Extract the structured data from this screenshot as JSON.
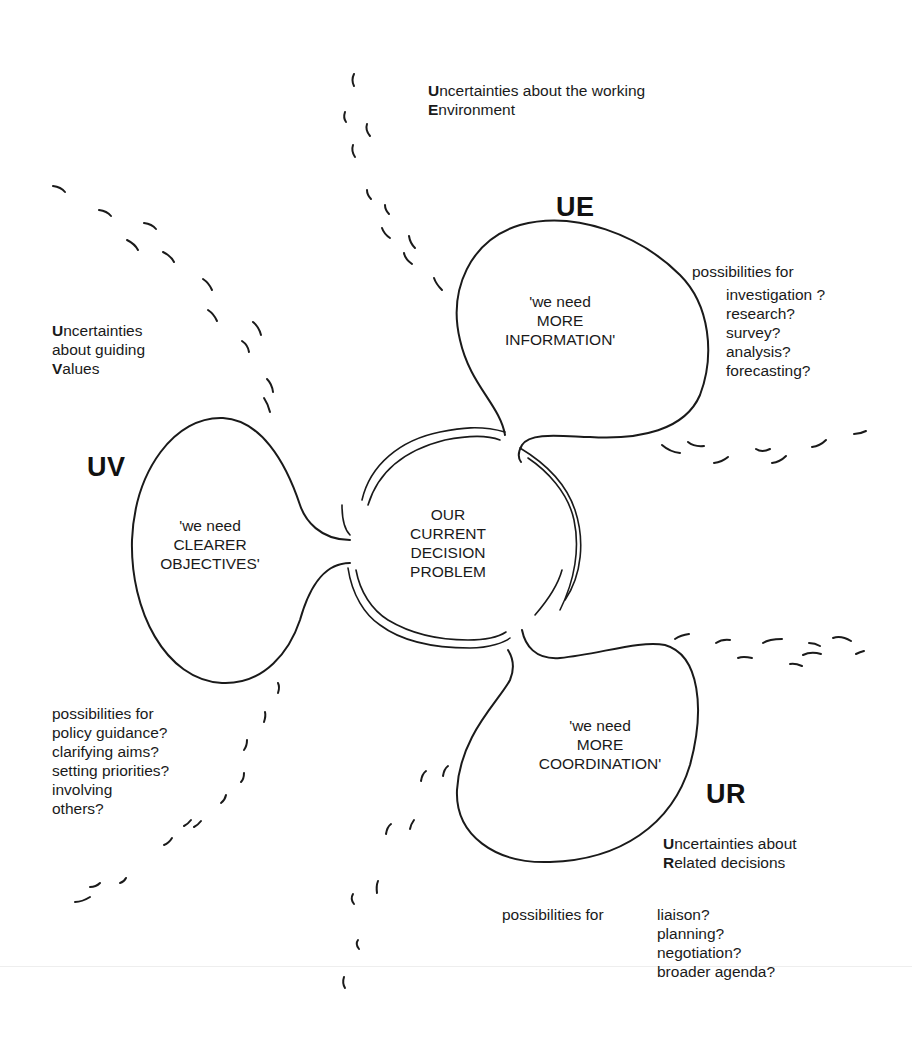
{
  "center": {
    "lines": [
      "OUR",
      "CURRENT",
      "DECISION",
      "PROBLEM"
    ]
  },
  "ue": {
    "code": "UE",
    "heading_line1_cap": "U",
    "heading_line1_rest": "ncertainties about the working",
    "heading_line2_cap": "E",
    "heading_line2_rest": "nvironment",
    "bubble_lines": [
      "'we need",
      "MORE",
      "INFORMATION'"
    ],
    "possibilities_label": "possibilities for",
    "possibilities": [
      "investigation ?",
      "research?",
      "survey?",
      "analysis?",
      "forecasting?"
    ]
  },
  "uv": {
    "code": "UV",
    "heading_line1_cap": "U",
    "heading_line1_rest": "ncertainties",
    "heading_line2": "about guiding",
    "heading_line3_cap": "V",
    "heading_line3_rest": "alues",
    "bubble_lines": [
      "'we need",
      "CLEARER",
      "OBJECTIVES'"
    ],
    "possibilities_label": "possibilities for",
    "possibilities": [
      "policy guidance?",
      "clarifying aims?",
      "setting priorities?",
      "involving",
      "others?"
    ]
  },
  "ur": {
    "code": "UR",
    "heading_line1_cap": "U",
    "heading_line1_rest": "ncertainties about",
    "heading_line2_cap": "R",
    "heading_line2_rest": "elated decisions",
    "bubble_lines": [
      "'we need",
      "MORE",
      "COORDINATION'"
    ],
    "possibilities_label": "possibilities for",
    "possibilities": [
      "liaison?",
      "planning?",
      "negotiation?",
      "broader agenda?"
    ]
  },
  "colors": {
    "ink": "#1a1a1a",
    "background": "#ffffff"
  }
}
